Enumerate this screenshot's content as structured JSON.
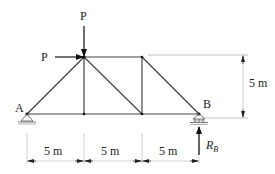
{
  "diagram": {
    "type": "truss",
    "loads": {
      "vertical": "P",
      "horizontal": "P"
    },
    "nodes": {
      "A": "A",
      "B": "B"
    },
    "reaction": {
      "symbol": "R",
      "subscript": "B"
    },
    "dimensions": {
      "horizontal": [
        "5 m",
        "5 m",
        "5 m"
      ],
      "vertical": "5 m"
    },
    "colors": {
      "line": "#333333",
      "dim": "#999999"
    }
  }
}
